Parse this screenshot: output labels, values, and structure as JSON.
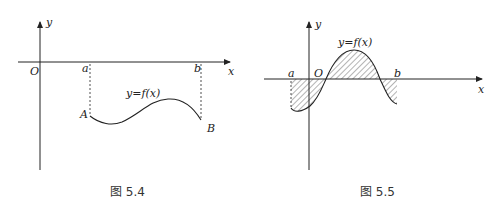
{
  "figures": [
    {
      "id": "fig-5-4",
      "caption": "图 5.4",
      "labels": {
        "y_axis": "y",
        "x_axis": "x",
        "origin": "O",
        "a": "a",
        "b": "b",
        "point_A": "A",
        "point_B": "B",
        "function": "y=f(x)"
      }
    },
    {
      "id": "fig-5-5",
      "caption": "图 5.5",
      "labels": {
        "y_axis": "y",
        "x_axis": "x",
        "origin": "O",
        "a": "a",
        "b": "b",
        "function": "y=f(x)"
      }
    }
  ]
}
